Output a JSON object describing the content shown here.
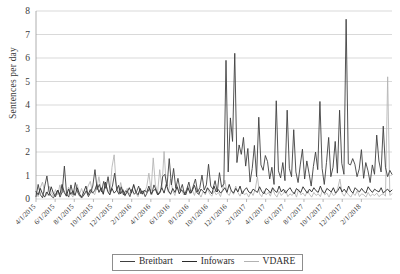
{
  "chart_data": {
    "type": "line",
    "title": "",
    "xlabel": "",
    "ylabel": "Sentences per day",
    "ylim": [
      0,
      8
    ],
    "yticks": [
      0,
      1,
      2,
      3,
      4,
      5,
      6,
      7,
      8
    ],
    "grid": true,
    "legend_position": "bottom",
    "xtick_labels": [
      "4/1/2015",
      "6/1/2015",
      "8/1/2015",
      "10/1/2015",
      "12/1/2015",
      "2/1/2016",
      "4/1/2016",
      "6/1/2016",
      "8/1/2016",
      "10/1/2016",
      "12/1/2016",
      "2/1/2017",
      "4/1/2017",
      "6/1/2017",
      "8/1/2017",
      "10/1/2017",
      "12/1/2017",
      "2/1/2018"
    ],
    "x_start": "4/1/2015",
    "x_end": "3/15/2018",
    "series": [
      {
        "name": "Breitbart",
        "color": "#404040",
        "values": [
          0.1,
          0.62,
          0.18,
          0.05,
          0.55,
          0.98,
          0.3,
          0.12,
          0.05,
          0.22,
          0.38,
          0.08,
          0.3,
          1.4,
          0.22,
          0.08,
          0.6,
          0.18,
          0.7,
          0.3,
          0.12,
          0.05,
          0.18,
          0.35,
          0.1,
          0.28,
          0.55,
          1.25,
          0.4,
          0.62,
          0.3,
          0.75,
          0.45,
          0.95,
          0.3,
          0.55,
          1.1,
          0.38,
          0.2,
          0.52,
          0.18,
          0.35,
          0.28,
          0.1,
          0.42,
          0.2,
          0.3,
          0.55,
          0.22,
          0.35,
          0.1,
          0.28,
          0.45,
          0.2,
          0.6,
          0.38,
          0.18,
          0.3,
          0.95,
          1.05,
          0.55,
          1.72,
          0.6,
          1.3,
          0.45,
          0.88,
          0.35,
          0.62,
          0.18,
          0.4,
          0.72,
          0.25,
          0.55,
          0.85,
          0.3,
          0.48,
          1.02,
          0.38,
          0.6,
          1.48,
          0.55,
          0.42,
          0.78,
          0.3,
          1.12,
          0.5,
          0.65,
          5.9,
          1.15,
          3.45,
          2.45,
          6.2,
          1.55,
          2.3,
          1.9,
          2.62,
          1.4,
          2.15,
          0.72,
          1.3,
          2.28,
          0.95,
          3.48,
          1.45,
          1.22,
          1.85,
          1.6,
          0.85,
          1.35,
          0.62,
          4.18,
          1.2,
          0.9,
          1.55,
          0.78,
          3.78,
          1.3,
          0.95,
          2.95,
          1.15,
          0.7,
          1.45,
          2.12,
          0.85,
          1.62,
          1.1,
          0.55,
          1.38,
          2.0,
          1.25,
          4.15,
          1.3,
          0.62,
          1.55,
          2.62,
          0.95,
          1.35,
          2.45,
          1.1,
          3.78,
          1.52,
          1.05,
          7.65,
          1.5,
          1.45,
          1.72,
          1.48,
          0.95,
          1.28,
          2.1,
          0.88,
          1.55,
          1.2,
          0.7,
          1.45,
          1.05,
          2.72,
          1.62,
          1.15,
          3.1,
          1.35,
          0.95,
          1.22,
          1.05
        ]
      },
      {
        "name": "Infowars",
        "color": "#2a2a2a",
        "values": [
          0.32,
          0.18,
          0.45,
          0.22,
          0.08,
          0.3,
          0.15,
          0.52,
          0.25,
          0.1,
          0.38,
          0.18,
          0.62,
          0.28,
          0.12,
          0.42,
          0.2,
          0.35,
          0.15,
          0.48,
          0.22,
          0.08,
          0.3,
          0.55,
          0.18,
          0.4,
          0.25,
          0.35,
          0.62,
          0.28,
          0.48,
          0.2,
          0.72,
          0.32,
          0.18,
          0.45,
          0.25,
          0.35,
          0.58,
          0.22,
          0.4,
          0.15,
          0.3,
          0.48,
          0.25,
          0.62,
          0.3,
          0.18,
          0.45,
          0.22,
          0.38,
          0.28,
          0.55,
          0.2,
          0.35,
          0.42,
          0.18,
          0.3,
          0.48,
          0.25,
          0.62,
          0.35,
          0.2,
          0.45,
          0.28,
          0.52,
          0.22,
          0.38,
          0.3,
          0.18,
          0.48,
          0.25,
          0.35,
          0.58,
          0.28,
          0.2,
          0.42,
          0.32,
          0.25,
          0.48,
          0.35,
          0.22,
          0.55,
          0.3,
          0.4,
          0.25,
          0.35,
          0.48,
          0.28,
          0.62,
          0.35,
          0.25,
          0.45,
          0.3,
          0.55,
          0.22,
          0.38,
          0.48,
          0.3,
          0.25,
          0.42,
          0.35,
          0.28,
          0.52,
          0.32,
          0.22,
          0.45,
          0.38,
          0.25,
          0.48,
          0.35,
          0.28,
          0.55,
          0.3,
          0.42,
          0.25,
          0.38,
          0.48,
          0.32,
          0.22,
          0.45,
          0.35,
          0.28,
          0.52,
          0.38,
          0.25,
          0.42,
          0.3,
          0.48,
          0.35,
          0.28,
          0.55,
          0.32,
          0.25,
          0.45,
          0.38,
          0.3,
          0.48,
          0.25,
          0.35,
          0.52,
          0.3,
          0.42,
          0.28,
          0.55,
          0.35,
          0.25,
          0.48,
          0.38,
          0.3,
          0.45,
          0.32,
          0.25,
          0.52,
          0.38,
          0.28,
          0.42,
          0.35,
          0.3,
          0.48,
          0.25,
          0.35,
          0.42,
          0.3,
          0.38
        ]
      },
      {
        "name": "VDARE",
        "color": "#b2b2b2",
        "values": [
          0.25,
          0.1,
          0.48,
          0.72,
          0.3,
          0.15,
          0.55,
          0.28,
          0.12,
          0.4,
          0.18,
          0.6,
          0.25,
          0.35,
          0.15,
          0.5,
          0.22,
          0.08,
          0.38,
          0.62,
          0.2,
          0.45,
          0.15,
          0.28,
          0.55,
          0.75,
          0.3,
          0.18,
          0.48,
          0.95,
          0.35,
          0.22,
          0.62,
          0.4,
          0.18,
          1.35,
          1.88,
          0.55,
          0.25,
          0.7,
          0.32,
          0.12,
          0.45,
          0.2,
          0.35,
          0.58,
          0.25,
          0.1,
          0.42,
          0.18,
          0.3,
          0.52,
          1.1,
          0.35,
          1.75,
          0.6,
          0.25,
          1.25,
          0.48,
          2.02,
          0.62,
          0.28,
          0.85,
          0.35,
          0.15,
          0.58,
          0.25,
          0.42,
          0.18,
          0.3,
          0.55,
          0.22,
          0.38,
          0.15,
          0.48,
          0.25,
          0.08,
          0.32,
          0.18,
          0.45,
          0.22,
          0.12,
          0.35,
          0.18,
          0.28,
          0.1,
          0.42,
          0.8,
          0.25,
          0.15,
          0.38,
          0.2,
          0.55,
          0.28,
          0.12,
          0.35,
          0.18,
          0.25,
          0.08,
          0.3,
          0.15,
          0.42,
          0.95,
          0.22,
          0.1,
          0.35,
          0.18,
          0.28,
          0.12,
          0.45,
          0.2,
          0.08,
          0.32,
          0.15,
          0.25,
          0.38,
          0.1,
          0.22,
          0.15,
          0.3,
          0.08,
          0.42,
          0.18,
          0.25,
          0.12,
          0.35,
          0.2,
          0.08,
          0.28,
          0.15,
          0.22,
          0.1,
          0.38,
          0.18,
          0.25,
          0.08,
          0.3,
          0.15,
          0.2,
          0.45,
          0.85,
          0.25,
          0.12,
          0.3,
          0.18,
          0.08,
          0.25,
          0.15,
          0.35,
          0.1,
          0.22,
          0.18,
          0.08,
          0.28,
          0.12,
          0.2,
          0.15,
          0.25,
          0.1,
          0.18,
          0.22,
          0.12,
          5.2,
          0.15,
          0.22
        ]
      }
    ]
  },
  "legend": {
    "items": [
      {
        "label": "Breitbart",
        "color": "#404040"
      },
      {
        "label": "Infowars",
        "color": "#2a2a2a"
      },
      {
        "label": "VDARE",
        "color": "#b2b2b2"
      }
    ]
  }
}
